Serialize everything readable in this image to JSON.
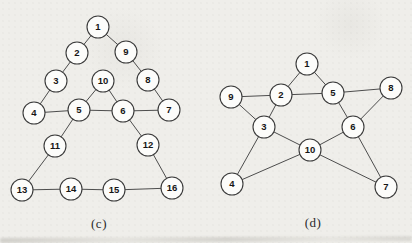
{
  "colors": {
    "paper": "#efeeea",
    "node_fill": "#fcfcfa",
    "node_stroke": "#3a3a3a",
    "edge": "#4d4d4d",
    "number_text": "#161616",
    "caption_text": "#2a2a2a"
  },
  "figures": [
    {
      "key": "c",
      "label": "(c)",
      "node_radius": 11,
      "nodes": [
        {
          "id": "1",
          "x": 98,
          "y": 27
        },
        {
          "id": "2",
          "x": 77,
          "y": 53
        },
        {
          "id": "3",
          "x": 56,
          "y": 81
        },
        {
          "id": "4",
          "x": 34,
          "y": 113
        },
        {
          "id": "5",
          "x": 79,
          "y": 110
        },
        {
          "id": "6",
          "x": 123,
          "y": 111
        },
        {
          "id": "7",
          "x": 169,
          "y": 110
        },
        {
          "id": "8",
          "x": 148,
          "y": 80
        },
        {
          "id": "9",
          "x": 126,
          "y": 52
        },
        {
          "id": "10",
          "x": 103,
          "y": 81
        },
        {
          "id": "11",
          "x": 55,
          "y": 146
        },
        {
          "id": "12",
          "x": 148,
          "y": 145
        },
        {
          "id": "13",
          "x": 22,
          "y": 190
        },
        {
          "id": "14",
          "x": 71,
          "y": 189
        },
        {
          "id": "15",
          "x": 114,
          "y": 190
        },
        {
          "id": "16",
          "x": 172,
          "y": 188
        }
      ],
      "edges": [
        [
          "1",
          "2"
        ],
        [
          "1",
          "9"
        ],
        [
          "2",
          "3"
        ],
        [
          "3",
          "4"
        ],
        [
          "4",
          "5"
        ],
        [
          "5",
          "10"
        ],
        [
          "6",
          "10"
        ],
        [
          "5",
          "6"
        ],
        [
          "6",
          "7"
        ],
        [
          "9",
          "8"
        ],
        [
          "8",
          "7"
        ],
        [
          "5",
          "11"
        ],
        [
          "6",
          "12"
        ],
        [
          "11",
          "13"
        ],
        [
          "12",
          "16"
        ],
        [
          "13",
          "14"
        ],
        [
          "14",
          "15"
        ],
        [
          "15",
          "16"
        ]
      ]
    },
    {
      "key": "d",
      "label": "(d)",
      "node_radius": 11,
      "nodes": [
        {
          "id": "1",
          "x": 307,
          "y": 64
        },
        {
          "id": "2",
          "x": 281,
          "y": 95
        },
        {
          "id": "3",
          "x": 264,
          "y": 127
        },
        {
          "id": "4",
          "x": 232,
          "y": 184
        },
        {
          "id": "5",
          "x": 333,
          "y": 93
        },
        {
          "id": "6",
          "x": 353,
          "y": 127
        },
        {
          "id": "7",
          "x": 386,
          "y": 187
        },
        {
          "id": "8",
          "x": 391,
          "y": 88
        },
        {
          "id": "9",
          "x": 231,
          "y": 97
        },
        {
          "id": "10",
          "x": 310,
          "y": 150
        }
      ],
      "edges": [
        [
          "1",
          "2"
        ],
        [
          "1",
          "5"
        ],
        [
          "2",
          "5"
        ],
        [
          "2",
          "9"
        ],
        [
          "2",
          "3"
        ],
        [
          "9",
          "3"
        ],
        [
          "3",
          "4"
        ],
        [
          "3",
          "10"
        ],
        [
          "4",
          "10"
        ],
        [
          "5",
          "8"
        ],
        [
          "5",
          "6"
        ],
        [
          "8",
          "6"
        ],
        [
          "6",
          "10"
        ],
        [
          "6",
          "7"
        ],
        [
          "10",
          "7"
        ]
      ]
    }
  ]
}
